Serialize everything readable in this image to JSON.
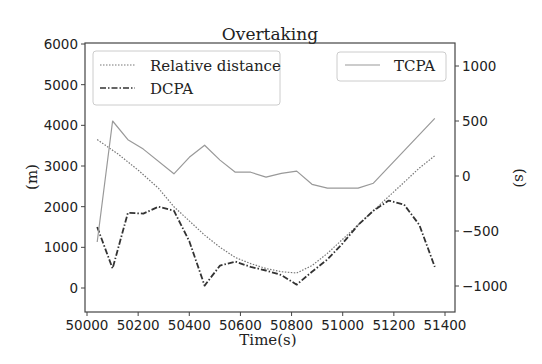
{
  "chart_data": {
    "type": "line",
    "title": "Overtaking",
    "xlabel": "Time(s)",
    "ylabel_left": "(m)",
    "ylabel_right": "(s)",
    "xlim": [
      49990,
      51440
    ],
    "ylim_left": [
      -600,
      6000
    ],
    "ylim_right": [
      -1200,
      1200
    ],
    "x_ticks": [
      50000,
      50200,
      50400,
      50600,
      50800,
      51000,
      51200,
      51400
    ],
    "y_ticks_left": [
      0,
      1000,
      2000,
      3000,
      4000,
      5000,
      6000
    ],
    "y_ticks_right": [
      -1000,
      -500,
      0,
      500,
      1000
    ],
    "grid": false,
    "legend": [
      {
        "label": "Relative distance",
        "style": "dotted",
        "axis": "left",
        "position": "upper left"
      },
      {
        "label": "DCPA",
        "style": "dashdot",
        "axis": "left",
        "position": "upper left"
      },
      {
        "label": "TCPA",
        "style": "solid",
        "axis": "right",
        "position": "upper right"
      }
    ],
    "series": [
      {
        "name": "Relative distance",
        "axis": "left",
        "x": [
          50040,
          50120,
          50200,
          50280,
          50340,
          50400,
          50460,
          50520,
          50580,
          50640,
          50700,
          50760,
          50820,
          50880,
          50940,
          51000,
          51060,
          51120,
          51180,
          51240,
          51300,
          51360
        ],
        "values": [
          3650,
          3300,
          2900,
          2450,
          2000,
          1650,
          1300,
          1000,
          750,
          600,
          480,
          400,
          370,
          550,
          850,
          1200,
          1550,
          1900,
          2250,
          2600,
          2950,
          3250
        ]
      },
      {
        "name": "DCPA",
        "axis": "left",
        "x": [
          50040,
          50100,
          50160,
          50220,
          50280,
          50340,
          50400,
          50460,
          50520,
          50580,
          50640,
          50700,
          50760,
          50820,
          50880,
          50940,
          51000,
          51060,
          51120,
          51180,
          51240,
          51300,
          51360
        ],
        "values": [
          1500,
          480,
          1850,
          1830,
          2000,
          1900,
          1150,
          60,
          550,
          650,
          520,
          430,
          320,
          80,
          400,
          700,
          1100,
          1550,
          1900,
          2150,
          2050,
          1550,
          520
        ]
      },
      {
        "name": "TCPA",
        "axis": "right",
        "x": [
          50040,
          50100,
          50160,
          50220,
          50340,
          50400,
          50460,
          50520,
          50580,
          50640,
          50700,
          50760,
          50820,
          50880,
          50940,
          51060,
          51120,
          51360
        ],
        "values": [
          -600,
          500,
          330,
          245,
          20,
          170,
          280,
          145,
          35,
          35,
          -10,
          25,
          45,
          -75,
          -110,
          -110,
          -65,
          525
        ]
      }
    ]
  }
}
